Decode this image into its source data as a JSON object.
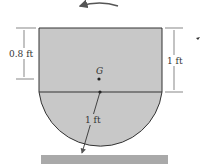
{
  "diagram": {
    "labels": {
      "left_dim": "0.8 ft",
      "right_dim": "1 ft",
      "radius": "1 ft",
      "center_of_mass": "G"
    },
    "colors": {
      "body_fill": "#c8c8c8",
      "ground_fill": "#a9a9a9",
      "line": "#333333"
    },
    "annotations": {
      "rotation": "counterclockwise"
    }
  }
}
